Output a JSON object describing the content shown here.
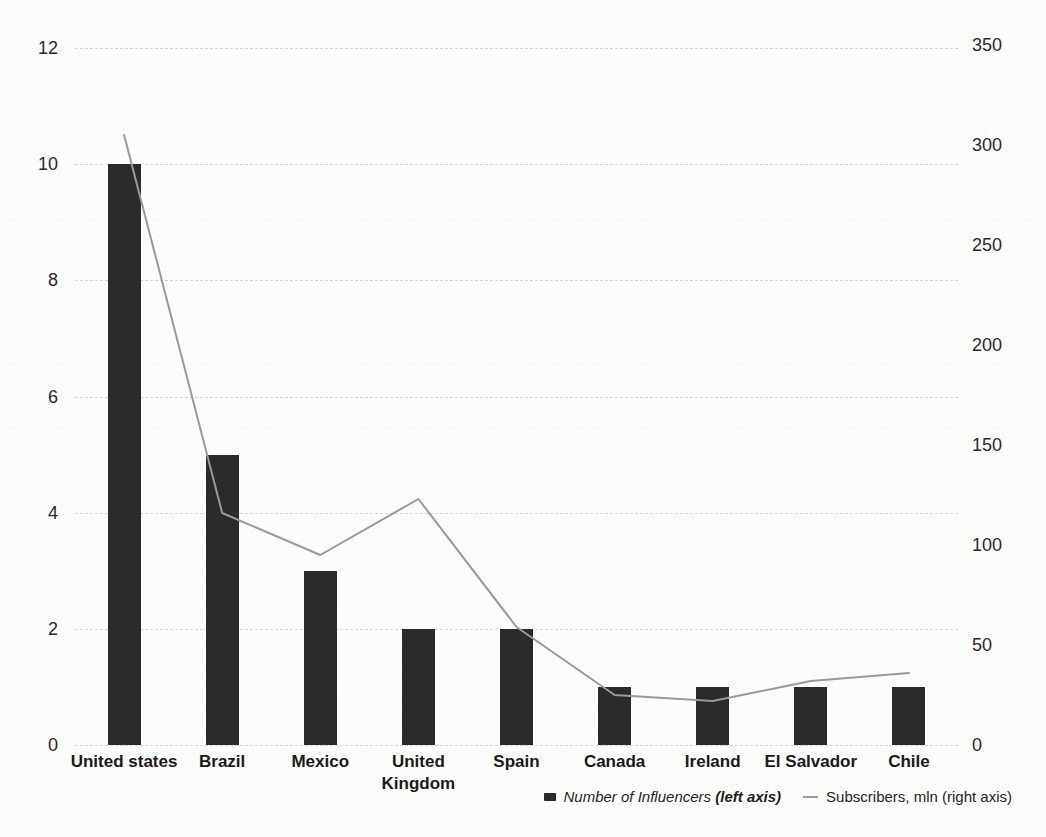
{
  "chart_data": {
    "type": "combo-bar-line",
    "categories": [
      "United states",
      "Brazil",
      "Mexico",
      "United Kingdom",
      "Spain",
      "Canada",
      "Ireland",
      "El Salvador",
      "Chile"
    ],
    "series": [
      {
        "name": "Number of Influencers",
        "type": "bar",
        "axis": "left",
        "values": [
          10,
          5,
          3,
          2,
          2,
          1,
          1,
          1,
          1
        ],
        "color": "#2b2b2b"
      },
      {
        "name": "Subscribers, mln",
        "type": "line",
        "axis": "right",
        "values": [
          305,
          116,
          95,
          123,
          59,
          25,
          22,
          32,
          36
        ],
        "color": "#9a9a9a"
      }
    ],
    "left_axis": {
      "ticks": [
        0,
        2,
        4,
        6,
        8,
        10,
        12
      ],
      "range": [
        0,
        12
      ]
    },
    "right_axis": {
      "ticks": [
        0,
        50,
        100,
        150,
        200,
        250,
        300,
        350
      ],
      "range": [
        0,
        350
      ]
    },
    "grid": true,
    "legend_position": "bottom-right",
    "legend": {
      "influencers_label": "Number of Influencers ",
      "influencers_axis_note": "(left axis)",
      "subscribers_label": "Subscribers, mln (right axis)"
    }
  },
  "colors": {
    "bar": "#2b2b2b",
    "line": "#9a9a9a",
    "grid": "#d6d6d0",
    "text": "#1c1c1c",
    "background": "#fcfcfa"
  }
}
